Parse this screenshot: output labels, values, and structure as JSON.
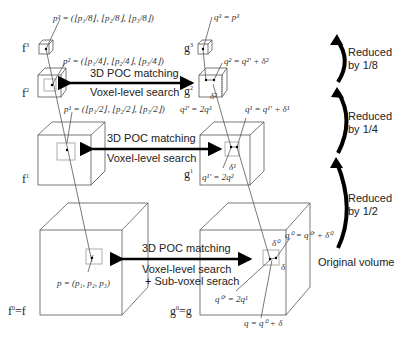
{
  "diagram": {
    "type": "coarse-to-fine 3D POC matching pyramid",
    "levels": [
      {
        "level": 3,
        "left_volume": "f³",
        "right_volume": "g³",
        "left_point": "p³ = (⌊p₁/8⌋, ⌊p₂/8⌋, ⌊p₃/8⌋)",
        "right_point": "q³ = p³",
        "reduction": "Reduced by 1/8"
      },
      {
        "level": 2,
        "left_volume": "f²",
        "right_volume": "g²",
        "left_point": "p² = (⌊p₁/4⌋, ⌊p₂/4⌋, ⌊p₃/4⌋)",
        "right_point": "q² = q²' + δ²",
        "initial": "q²' = 2q³",
        "displacement": "δ²",
        "matching": "3D POC matching",
        "search": "Voxel-level search",
        "reduction": "Reduced by 1/4"
      },
      {
        "level": 1,
        "left_volume": "f¹",
        "right_volume": "g¹",
        "left_point": "p¹ = (⌊p₁/2⌋, ⌊p₂/2⌋, ⌊p₃/2⌋)",
        "right_point": "q¹ = q¹' + δ¹",
        "initial": "q¹' = 2q²",
        "displacement": "δ¹",
        "matching": "3D POC matching",
        "search": "Voxel-level search",
        "reduction": "Reduced by 1/2"
      },
      {
        "level": 0,
        "left_volume": "f⁰ = f",
        "right_volume": "g⁰ = g",
        "left_point": "p = (p₁, p₂, p₃)",
        "right_point": "q⁰ = q⁰' + δ⁰",
        "initial": "q⁰' = 2q¹",
        "displacement": "δ⁰",
        "subvoxel": "δ",
        "final": "q = q⁰ + δ",
        "matching": "3D POC matching",
        "search": "Voxel-level search",
        "search2": "+ Sub-voxel serach",
        "note": "Original volume"
      }
    ]
  },
  "labels": {
    "vol_f3": "f",
    "vol_f3_sup": "3",
    "vol_f2": "f",
    "vol_f2_sup": "2",
    "vol_f1": "f",
    "vol_f1_sup": "1",
    "vol_f0": "f",
    "vol_f0_sup": "0",
    "vol_f0_eq": "=f",
    "vol_g3": "g",
    "vol_g3_sup": "3",
    "vol_g2": "g",
    "vol_g2_sup": "2",
    "vol_g1": "g",
    "vol_g1_sup": "1",
    "vol_g0": "g",
    "vol_g0_sup": "0",
    "vol_g0_eq": "=g",
    "p3": "p³ = (⌊p₁/8⌋, ⌊p₂/8⌋, ⌊p₃/8⌋)",
    "p2": "p² = (⌊p₁/4⌋, ⌊p₂/4⌋, ⌊p₃/4⌋)",
    "p1": "p¹ = (⌊p₁/2⌋, ⌊p₂/2⌋, ⌊p₃/2⌋)",
    "p0": "p = (p₁, p₂, p₃)",
    "q3": "q³ = p³",
    "q2": "q² = q²' + δ²",
    "q2i": "q²' = 2q³",
    "d2": "δ²",
    "q1": "q¹ = q¹' + δ¹",
    "q1i": "q¹' = 2q²",
    "d1": "δ¹",
    "q0": "q⁰ = q⁰' + δ⁰",
    "q0i": "q⁰' = 2q¹",
    "d0": "δ⁰",
    "d": "δ",
    "qf": "q = q⁰ + δ",
    "m2a": "3D POC matching",
    "m2b": "Voxel-level search",
    "m1a": "3D POC matching",
    "m1b": "Voxel-level search",
    "m0a": "3D POC matching",
    "m0b": "Voxel-level search",
    "m0c": "+ Sub-voxel serach",
    "r8a": "Reduced",
    "r8b": "by 1/8",
    "r4a": "Reduced",
    "r4b": "by 1/4",
    "r2a": "Reduced",
    "r2b": "by 1/2",
    "orig": "Original volume"
  },
  "colors": {
    "line": "#555555",
    "arrow": "#000000",
    "text": "#222222",
    "subbox": "#999999"
  }
}
